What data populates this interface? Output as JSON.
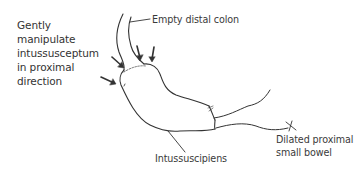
{
  "diagram": {
    "type": "medical-illustration",
    "labels": {
      "instruction": "Gently\nmanipulate\nintussusceptum\nin proximal\ndirection",
      "distal_colon": "Empty distal colon",
      "intussuscipiens": "Intussuscipiens",
      "small_bowel": "Dilated proximal\nsmall bowel"
    },
    "arrows": [
      {
        "name": "arrow-left-1",
        "direction": "down-right"
      },
      {
        "name": "arrow-left-2",
        "direction": "right"
      },
      {
        "name": "arrow-top-1",
        "direction": "down"
      },
      {
        "name": "arrow-top-2",
        "direction": "down"
      }
    ],
    "colors": {
      "stroke": "#333333",
      "text": "#3a3a3a",
      "background": "#ffffff"
    }
  }
}
